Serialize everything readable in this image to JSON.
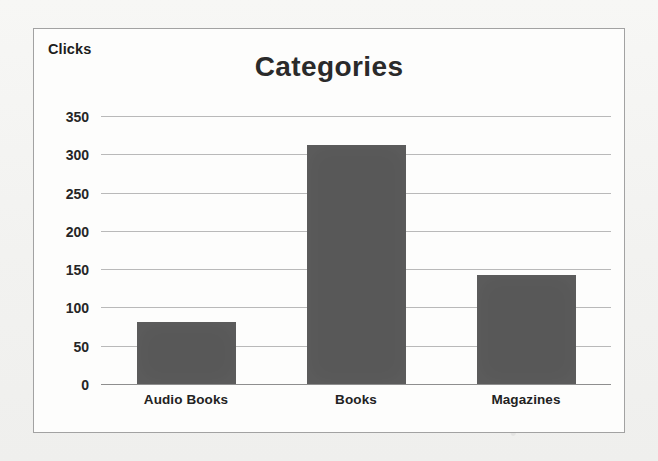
{
  "chart_data": {
    "type": "bar",
    "title": "Categories",
    "xlabel": "",
    "ylabel": "Clicks",
    "categories": [
      "Audio Books",
      "Books",
      "Magazines"
    ],
    "values": [
      81,
      312,
      143
    ],
    "ylim": [
      0,
      350
    ],
    "ytick_labels": [
      "350",
      "300",
      "250",
      "200",
      "150",
      "100",
      "50",
      "0"
    ],
    "ytick_values": [
      350,
      300,
      250,
      200,
      150,
      100,
      50,
      0
    ],
    "grid": true,
    "legend": "none",
    "bar_color": "#585858",
    "gridline_color": "#b9b9b9",
    "axis_color": "#8e8e8e",
    "plot_background": "#fdfdfc",
    "page_background": "#f4f4f2",
    "border_color": "#a2a2a2"
  }
}
